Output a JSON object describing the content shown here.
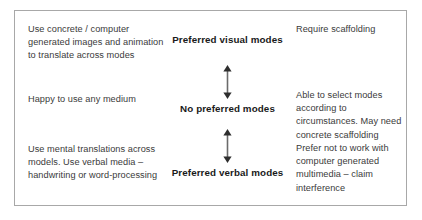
{
  "diagram": {
    "border_color": "#a8a8a8",
    "text_color": "#3a3a3a",
    "label_color": "#1a1a1a",
    "arrow_color": "#4a4a4a",
    "columns": {
      "left_heading": "Strategies",
      "center_heading": "Mode preference",
      "right_heading": "Support needs"
    },
    "rows": [
      {
        "id": "visual",
        "left": "Use concrete / computer generated images and animation to translate across modes",
        "center": "Preferred visual modes",
        "right": "Require scaffolding"
      },
      {
        "id": "neutral",
        "left": "Happy to use any medium",
        "center": "No preferred modes",
        "right": "Able to select modes according to circumstances. May need concrete scaffolding"
      },
      {
        "id": "verbal",
        "left": "Use mental translations across models. Use verbal media – handwriting or word-processing",
        "center": "Preferred verbal modes",
        "right": "Prefer not to work with computer generated multimedia – claim interference"
      }
    ],
    "arrows": [
      {
        "id": "arrow-visual-to-neutral",
        "type": "double-headed-vertical"
      },
      {
        "id": "arrow-neutral-to-verbal",
        "type": "double-headed-vertical"
      }
    ]
  }
}
